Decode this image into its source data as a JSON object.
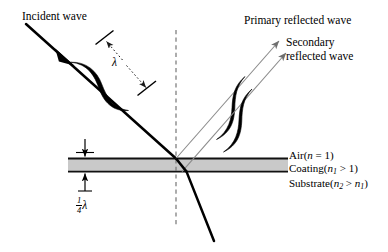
{
  "figure": {
    "background": "#ffffff",
    "ink": "#000000",
    "coating_fill": "#c9c9c9",
    "ray_thin": "#8a8a8a"
  },
  "labels": {
    "incident_wave": "Incident wave",
    "primary_reflected": "Primary reflected wave",
    "secondary_reflected_line1": "Secondary",
    "secondary_reflected_line2": "reflected wave",
    "wavelength_symbol": "λ",
    "quarter_numerator": "1",
    "quarter_denominator": "4",
    "quarter_lambda_symbol": "λ"
  },
  "media": [
    {
      "name": "Air",
      "index_expr_open": "(",
      "symbol": "n",
      "subscript": "",
      "relation": " = 1",
      "index_expr_close": ")"
    },
    {
      "name": "Coating",
      "index_expr_open": "(",
      "symbol": "n",
      "subscript": "1",
      "relation": " > 1",
      "index_expr_close": ")"
    },
    {
      "name": "Substrate",
      "index_expr_open": "(",
      "symbol": "n",
      "subscript": "2",
      "relation": " > ",
      "tail_symbol": "n",
      "tail_subscript": "1",
      "index_expr_close": ")"
    }
  ],
  "geometry": {
    "coating_left": 68,
    "coating_right": 288,
    "coating_top": 158,
    "coating_bottom": 172,
    "normal_x": 176,
    "normal_top": 30,
    "normal_bottom": 226,
    "thickness_label": "quarter wavelength"
  }
}
